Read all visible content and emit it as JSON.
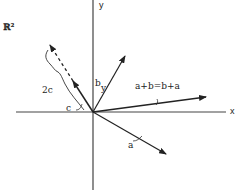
{
  "diagram": {
    "space_label": "ℝ²",
    "axes": {
      "x_label": "x",
      "y_label": "y"
    },
    "vectors": {
      "a": {
        "label": "a"
      },
      "b": {
        "label": "b"
      },
      "b_sub": {
        "label": "y"
      },
      "sum": {
        "label": "a+b=b+a"
      },
      "c": {
        "label": "c"
      },
      "two_c": {
        "label": "2c"
      }
    },
    "colors": {
      "ink": "#222222",
      "background": "#ffffff"
    }
  }
}
